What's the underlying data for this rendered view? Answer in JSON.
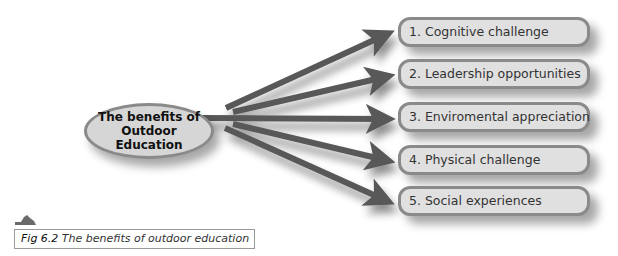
{
  "diagram": {
    "center": {
      "line1": "The benefits of",
      "line2": "Outdoor Education"
    },
    "items": [
      {
        "label": "1. Cognitive challenge"
      },
      {
        "label": "2. Leadership opportunities"
      },
      {
        "label": "3. Enviromental appreciation"
      },
      {
        "label": "4. Physical challenge"
      },
      {
        "label": "5. Social experiences"
      }
    ],
    "colors": {
      "arrow": "#595959",
      "box_fill": "#e0e0e0",
      "box_border": "#8a8a8a"
    }
  },
  "caption": {
    "fig": "Fig 6.2",
    "text": " The benefits of outdoor education"
  }
}
